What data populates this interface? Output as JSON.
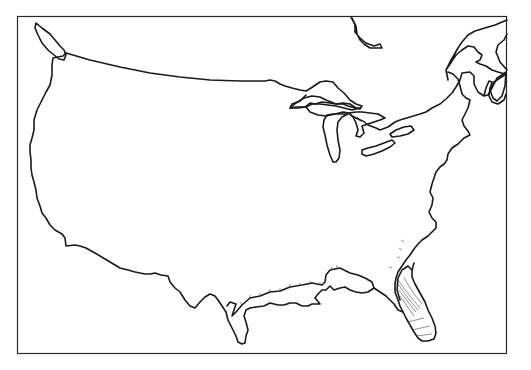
{
  "map": {
    "type": "outline-map",
    "region": "Contiguous United States",
    "style": "black line drawing on white, no labels",
    "colors": {
      "background": "#ffffff",
      "outline": "#1a1a1a",
      "frame": "#2a2a2a"
    },
    "features": [
      "country-outline",
      "canada-border",
      "great-lakes",
      "hudson-bay-southern-tip",
      "gulf-of-st-lawrence",
      "nova-scotia",
      "vancouver-island",
      "florida-peninsula",
      "gulf-coast",
      "atlantic-coast",
      "coastal-plain-hatching"
    ],
    "labels": []
  }
}
